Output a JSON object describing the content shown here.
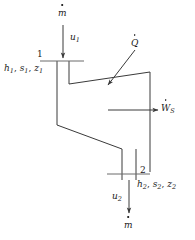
{
  "figure": {
    "type": "thermodynamic-control-volume",
    "colors": {
      "line": "#3a3a3a",
      "text": "#1a1a1a",
      "background": "#ffffff"
    }
  },
  "labels": {
    "inlet_mass_flow": {
      "symbol": "m",
      "dot": true
    },
    "inlet_velocity": {
      "symbol": "u",
      "sub": "1"
    },
    "station_1_number": "1",
    "station_1_props": [
      {
        "symbol": "h",
        "sub": "1"
      },
      {
        "symbol": "s",
        "sub": "1"
      },
      {
        "symbol": "z",
        "sub": "1"
      }
    ],
    "heat_rate": {
      "symbol": "Q",
      "dot": true
    },
    "shaft_work": {
      "symbol": "W",
      "sub": "S",
      "dot": true
    },
    "station_2_number": "2",
    "station_2_props": [
      {
        "symbol": "h",
        "sub": "2"
      },
      {
        "symbol": "s",
        "sub": "2"
      },
      {
        "symbol": "z",
        "sub": "2"
      }
    ],
    "outlet_velocity": {
      "symbol": "u",
      "sub": "2"
    },
    "outlet_mass_flow": {
      "symbol": "m",
      "dot": true
    }
  },
  "text": {
    "m_dot": "m",
    "u1": "u",
    "u1_sub": "1",
    "one": "1",
    "h1": "h",
    "h1_sub": "1",
    "s1": "s",
    "s1_sub": "1",
    "z1": "z",
    "z1_sub": "1",
    "comma1": ", ",
    "comma2": ", ",
    "Q_dot": "Q",
    "W_dot": "W",
    "W_sub": "S",
    "two": "2",
    "h2": "h",
    "h2_sub": "2",
    "s2": "s",
    "s2_sub": "2",
    "z2": "z",
    "z2_sub": "2",
    "comma3": ", ",
    "comma4": ", ",
    "u2": "u",
    "u2_sub": "2",
    "m_dot_out": "m"
  }
}
